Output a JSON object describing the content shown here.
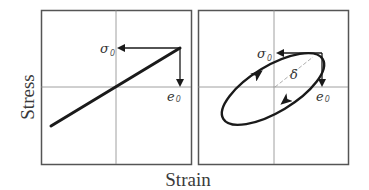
{
  "figure": {
    "x_axis_label": "Strain",
    "y_axis_label": "Stress",
    "colors": {
      "curve": "#1a1a1a",
      "frame": "#555555",
      "grid": "#888888",
      "background": "#ffffff"
    }
  },
  "panels": [
    {
      "id": "elastic",
      "description": "Linear stress-strain line through origin (in-phase response)",
      "labels": {
        "stress_amplitude": {
          "symbol": "σ",
          "subscript": "0"
        },
        "strain_amplitude": {
          "symbol": "e",
          "subscript": "0"
        }
      }
    },
    {
      "id": "viscoelastic",
      "description": "Elliptical hysteresis loop with phase angle δ",
      "labels": {
        "stress_amplitude": {
          "symbol": "σ",
          "subscript": "0"
        },
        "strain_amplitude": {
          "symbol": "e",
          "subscript": "0"
        },
        "phase_angle": "δ"
      }
    }
  ]
}
